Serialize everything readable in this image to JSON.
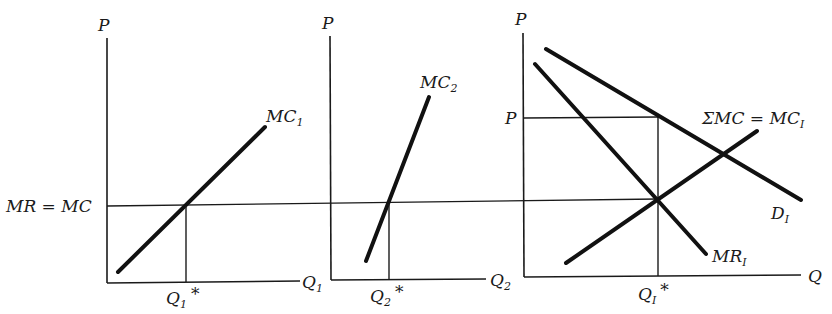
{
  "diagram": {
    "type": "economics-multiplant-monopoly",
    "colors": {
      "ink": "#111111",
      "background": "#ffffff"
    },
    "shared_level_label": "MR = MC",
    "panels": [
      {
        "id": "plant-1",
        "y_axis_label": "P",
        "x_axis_label": "Q",
        "x_axis_sub": "1",
        "curve_label": "MC",
        "curve_sub": "1",
        "equilibrium_label": "Q",
        "equilibrium_sub": "1",
        "equilibrium_mark": "*"
      },
      {
        "id": "plant-2",
        "y_axis_label": "P",
        "x_axis_label": "Q",
        "x_axis_sub": "2",
        "curve_label": "MC",
        "curve_sub": "2",
        "equilibrium_label": "Q",
        "equilibrium_sub": "2",
        "equilibrium_mark": "*"
      },
      {
        "id": "industry",
        "y_axis_label": "P",
        "price_label": "P",
        "x_axis_label": "Q",
        "mc_label": "ΣMC = MC",
        "mc_sub": "I",
        "demand_label": "D",
        "demand_sub": "I",
        "mr_label": "MR",
        "mr_sub": "I",
        "equilibrium_label": "Q",
        "equilibrium_sub": "I",
        "equilibrium_mark": "*"
      }
    ]
  }
}
